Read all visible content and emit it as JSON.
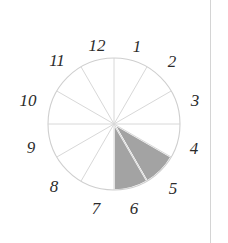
{
  "figure": {
    "background_color": "#ffffff",
    "width": 228,
    "height": 243
  },
  "clock": {
    "center_x": 114,
    "center_y": 124,
    "radius": 66,
    "sector_count": 12,
    "outline_color": "#cfcfcf",
    "spoke_color": "#d8d8d8",
    "shaded_color": "#a3a3a3",
    "shaded_separator_color": "#ffffff",
    "label_color": "#2b2b2b",
    "hour_labels": [
      {
        "text": "1",
        "x": 137,
        "y": 46
      },
      {
        "text": "2",
        "x": 172,
        "y": 61
      },
      {
        "text": "3",
        "x": 195,
        "y": 100
      },
      {
        "text": "4",
        "x": 194,
        "y": 148
      },
      {
        "text": "5",
        "x": 173,
        "y": 188
      },
      {
        "text": "6",
        "x": 134,
        "y": 208
      },
      {
        "text": "7",
        "x": 96,
        "y": 208
      },
      {
        "text": "8",
        "x": 54,
        "y": 186
      },
      {
        "text": "9",
        "x": 31,
        "y": 147
      },
      {
        "text": "10",
        "x": 28,
        "y": 100
      },
      {
        "text": "11",
        "x": 57,
        "y": 60
      },
      {
        "text": "12",
        "x": 97,
        "y": 45
      }
    ],
    "shaded_sectors": [
      {
        "name": "sector-4-to-5",
        "start_hour": 4,
        "end_hour": 5
      },
      {
        "name": "sector-5-to-6",
        "start_hour": 5,
        "end_hour": 6
      }
    ]
  },
  "right_rule": {
    "x": 210,
    "color": "#d4d4d4"
  },
  "chart_data": {
    "type": "pie",
    "categories": [
      "1",
      "2",
      "3",
      "4",
      "5",
      "6",
      "7",
      "8",
      "9",
      "10",
      "11",
      "12"
    ],
    "values": [
      1,
      1,
      1,
      1,
      1,
      1,
      1,
      1,
      1,
      1,
      1,
      1
    ],
    "xlabel": "",
    "ylabel": "",
    "legend": [],
    "grid": false,
    "annotations": [
      "Sectors spanning clock hours 4-5 and 5-6 are filled gray",
      "All other sectors are unfilled (white)"
    ],
    "slice_fills": [
      "#ffffff",
      "#ffffff",
      "#ffffff",
      "#ffffff",
      "#a3a3a3",
      "#a3a3a3",
      "#ffffff",
      "#ffffff",
      "#ffffff",
      "#ffffff",
      "#ffffff",
      "#ffffff"
    ],
    "slice_labels_order": [
      "12-to-1",
      "1-to-2",
      "2-to-3",
      "3-to-4",
      "4-to-5",
      "5-to-6",
      "6-to-7",
      "7-to-8",
      "8-to-9",
      "9-to-10",
      "10-to-11",
      "11-to-12"
    ]
  }
}
